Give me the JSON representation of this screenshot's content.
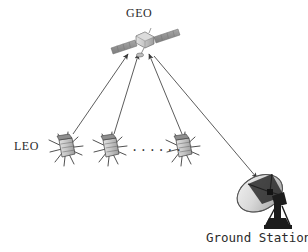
{
  "figure": {
    "type": "diagram",
    "background_color": "#ffffff",
    "line_color": "#4a4a4a",
    "panel_color": "#9a9a9a",
    "body_color": "#c9c9c9",
    "dish_color": "#2a2a2a"
  },
  "labels": {
    "geo": "GEO",
    "leo": "LEO",
    "ground_station": "Ground Station",
    "ellipsis": "······"
  },
  "nodes": {
    "geo_satellite": {
      "name": "GEO satellite",
      "x": 145,
      "y": 40
    },
    "leo_satellites": [
      {
        "name": "LEO satellite 1",
        "x": 66,
        "y": 148
      },
      {
        "name": "LEO satellite 2",
        "x": 110,
        "y": 148
      },
      {
        "name": "LEO satellite 3",
        "x": 183,
        "y": 148
      }
    ],
    "ground_station": {
      "name": "Ground station dish",
      "x": 268,
      "y": 198
    }
  },
  "links": [
    {
      "name": "leo1-to-geo",
      "from": "LEO satellite 1",
      "to": "GEO satellite",
      "arrow": "to-geo",
      "x1": 73,
      "y1": 134,
      "x2": 128,
      "y2": 53
    },
    {
      "name": "leo2-to-geo",
      "from": "LEO satellite 2",
      "to": "GEO satellite",
      "arrow": "to-geo",
      "x1": 114,
      "y1": 134,
      "x2": 138,
      "y2": 53
    },
    {
      "name": "leo3-to-geo",
      "from": "LEO satellite 3",
      "to": "GEO satellite",
      "arrow": "to-geo",
      "x1": 182,
      "y1": 134,
      "x2": 149,
      "y2": 53
    },
    {
      "name": "geo-to-ground-station",
      "from": "GEO satellite",
      "to": "Ground station dish",
      "arrow": "to-ground",
      "x1": 153,
      "y1": 55,
      "x2": 256,
      "y2": 177
    }
  ]
}
